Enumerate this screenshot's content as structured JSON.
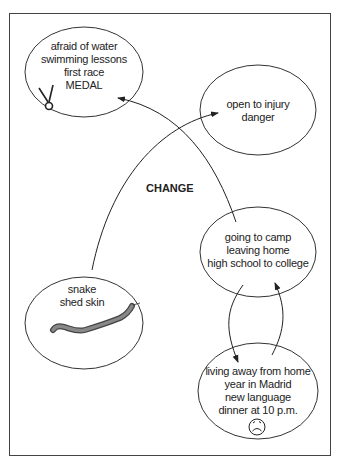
{
  "diagram": {
    "change_label": "CHANGE",
    "nodes": [
      {
        "id": "swimming",
        "lines": [
          "afraid of water",
          "swimming lessons",
          "first race",
          "MEDAL"
        ],
        "icon": "medal-icon"
      },
      {
        "id": "injury",
        "lines": [
          "open to injury",
          "danger"
        ]
      },
      {
        "id": "camp",
        "lines": [
          "going to camp",
          "leaving home",
          "high school to college"
        ]
      },
      {
        "id": "snake",
        "lines": [
          "snake",
          "shed skin"
        ],
        "icon": "snake-icon"
      },
      {
        "id": "madrid",
        "lines": [
          "living away from home",
          "year in Madrid",
          "new language",
          "dinner at 10 p.m."
        ],
        "icon": "sad-face-icon"
      }
    ],
    "edges": [
      {
        "from": "snake",
        "to": "injury"
      },
      {
        "from": "camp",
        "to": "swimming"
      },
      {
        "from": "camp",
        "to": "madrid"
      },
      {
        "from": "madrid",
        "to": "camp"
      }
    ]
  }
}
